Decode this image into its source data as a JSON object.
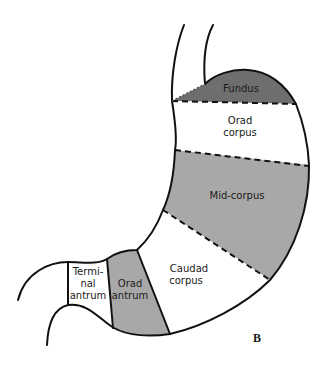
{
  "figure": {
    "panel_letter": "B"
  },
  "regions": [
    {
      "id": "fundus",
      "lines": [
        "Fundus"
      ],
      "fill": "#6e6e6e"
    },
    {
      "id": "orad-corpus",
      "lines": [
        "Orad",
        "corpus"
      ],
      "fill": "#ffffff"
    },
    {
      "id": "mid-corpus",
      "lines": [
        "Mid-corpus"
      ],
      "fill": "#a8a8a8"
    },
    {
      "id": "caudad-corpus",
      "lines": [
        "Caudad",
        "corpus"
      ],
      "fill": "#ffffff"
    },
    {
      "id": "orad-antrum",
      "lines": [
        "Orad",
        "antrum"
      ],
      "fill": "#a8a8a8"
    },
    {
      "id": "terminal-antrum",
      "lines": [
        "Termi-",
        "nal",
        "antrum"
      ],
      "fill": "#ffffff"
    }
  ],
  "colors": {
    "outline": "#111111",
    "dark_fill": "#6e6e6e",
    "medium_fill": "#a8a8a8",
    "background": "#ffffff"
  }
}
